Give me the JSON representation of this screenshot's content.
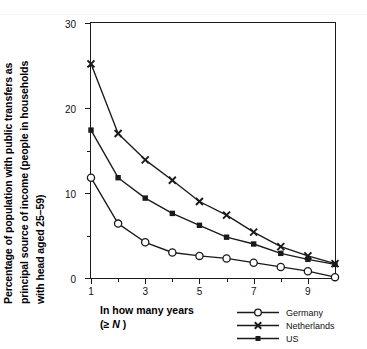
{
  "chart_data": {
    "type": "line",
    "title": "",
    "xlabel": "In how many years (≥ N )",
    "ylabel": "Percentage of population with public transfers as principal source of income (people in households with head aged 25–59)",
    "x": [
      1,
      2,
      3,
      4,
      5,
      6,
      7,
      8,
      9,
      10
    ],
    "xlim": [
      1,
      10
    ],
    "ylim": [
      0,
      30
    ],
    "grid": false,
    "legend_position": "bottom-right",
    "xticks_major": [
      1,
      3,
      5,
      7,
      9
    ],
    "xticks_minor": [
      2,
      4,
      6,
      8,
      10
    ],
    "yticks_major": [
      0,
      10,
      20,
      30
    ],
    "yticks_minor": [
      5,
      15,
      25
    ],
    "series": [
      {
        "name": "Germany",
        "marker": "open-circle",
        "values": [
          11.8,
          6.4,
          4.2,
          3.0,
          2.6,
          2.3,
          1.8,
          1.3,
          0.8,
          0.1
        ]
      },
      {
        "name": "Netherlands",
        "marker": "cross",
        "values": [
          25.2,
          17.0,
          13.9,
          11.5,
          9.0,
          7.4,
          5.4,
          3.7,
          2.6,
          1.7
        ]
      },
      {
        "name": "US",
        "marker": "filled-square",
        "values": [
          17.4,
          11.8,
          9.4,
          7.6,
          6.2,
          4.8,
          4.0,
          2.9,
          2.2,
          1.6
        ]
      }
    ]
  },
  "axis": {
    "ylabel_line1": "Percentage of population with public transfers as",
    "ylabel_line2": "principal source of income (people in households",
    "ylabel_line3": "with head aged 25–59)",
    "xlabel_line1": "In how many years",
    "xlabel_line2_prefix": "(",
    "xlabel_line2_symbol": "≥ ",
    "xlabel_line2_var": "N",
    "xlabel_line2_suffix": " )",
    "ytick_labels": [
      "0",
      "10",
      "20",
      "30"
    ],
    "xtick_labels": [
      "1",
      "3",
      "5",
      "7",
      "9"
    ]
  },
  "legend": {
    "items": [
      {
        "label": "Germany",
        "marker": "open-circle"
      },
      {
        "label": "Netherlands",
        "marker": "cross"
      },
      {
        "label": "US",
        "marker": "filled-square"
      }
    ]
  },
  "colors": {
    "line": "#1a1a1a",
    "axis": "#1a1a1a",
    "text": "#111111",
    "background": "#ffffff"
  }
}
